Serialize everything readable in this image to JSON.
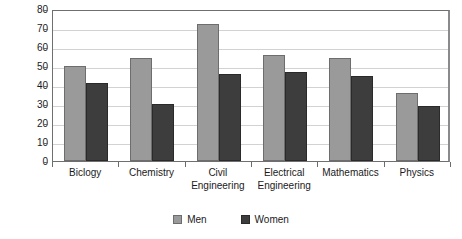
{
  "chart_data": {
    "type": "bar",
    "title": "",
    "xlabel": "",
    "ylabel": "Percent",
    "ylim": [
      0,
      80
    ],
    "ytick_step": 10,
    "yticks": [
      0,
      10,
      20,
      30,
      40,
      50,
      60,
      70,
      80
    ],
    "grid": true,
    "legend_position": "bottom",
    "categories": [
      "Biclogy",
      "Chemistry",
      "Civil Engineering",
      "Electrical Engineering",
      "Mathematics",
      "Physics"
    ],
    "series": [
      {
        "name": "Men",
        "color": "#9a9a9a",
        "values": [
          50,
          54,
          72,
          56,
          54,
          36
        ]
      },
      {
        "name": "Women",
        "color": "#3d3d3d",
        "values": [
          41,
          30,
          46,
          47,
          45,
          29
        ]
      }
    ]
  }
}
